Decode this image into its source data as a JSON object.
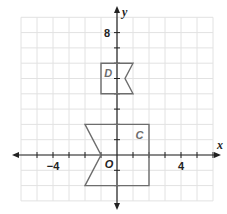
{
  "diagram": {
    "type": "coordinate-plane",
    "origin_px": [
      117,
      155
    ],
    "unit_px": {
      "x": 16,
      "y": 15.3
    },
    "grid": {
      "x_min": -6,
      "x_max": 6,
      "y_min": -3,
      "y_max": 9,
      "color": "#e2e2e2"
    },
    "axes": {
      "x_label": "x",
      "y_label": "y",
      "x_range_px": [
        12,
        221
      ],
      "y_range_px": [
        6,
        210
      ]
    },
    "tick_labels": [
      {
        "text": "−4",
        "axis": "x",
        "value": -4
      },
      {
        "text": "4",
        "axis": "x",
        "value": 4
      },
      {
        "text": "8",
        "axis": "y",
        "value": 8
      }
    ],
    "origin_label": "O",
    "shapes": [
      {
        "name": "C",
        "label_pos": [
          1.4,
          1.3
        ],
        "stroke": "#6d6d6d",
        "vertices": [
          [
            -2,
            2
          ],
          [
            2,
            2
          ],
          [
            2,
            -2
          ],
          [
            -2,
            -2
          ],
          [
            -1,
            0
          ]
        ]
      },
      {
        "name": "D",
        "label_pos": [
          -0.55,
          5.35
        ],
        "stroke": "#6d6d6d",
        "vertices": [
          [
            -1,
            6
          ],
          [
            1,
            6
          ],
          [
            0.5,
            5
          ],
          [
            1,
            4
          ],
          [
            -1,
            4
          ]
        ]
      }
    ]
  }
}
